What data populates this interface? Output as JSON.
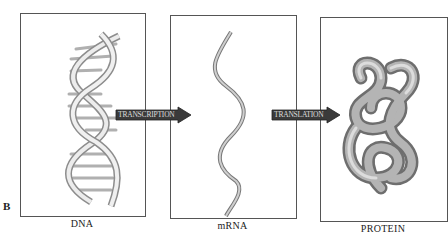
{
  "figure": {
    "panel_letter": "B",
    "panels": [
      {
        "id": "dna",
        "caption": "DNA",
        "illustration": "double-helix"
      },
      {
        "id": "mrna",
        "caption": "mRNA",
        "illustration": "single-strand-ribbon"
      },
      {
        "id": "protein",
        "caption": "PROTEIN",
        "illustration": "folded-polypeptide"
      }
    ],
    "arrows": [
      {
        "label": "TRANSCRIPTION",
        "from": "dna",
        "to": "mrna"
      },
      {
        "label": "TRANSLATION",
        "from": "mrna",
        "to": "protein"
      }
    ],
    "colors": {
      "border": "#555555",
      "arrow_fill": "#3a3a3a",
      "arrow_text": "#dddddd",
      "helix": "#bdbdbd",
      "protein": "#8a8a8a"
    }
  }
}
